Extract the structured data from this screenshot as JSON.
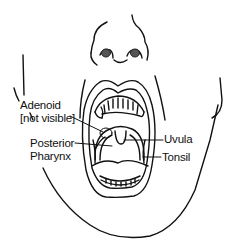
{
  "diagram": {
    "labels": [
      {
        "id": "adenoid",
        "lines": [
          "Adenoid",
          "[not visible]"
        ],
        "x": 20,
        "y": 99
      },
      {
        "id": "posterior-pharynx",
        "lines": [
          "Posterior",
          "Pharynx"
        ],
        "x": 30,
        "y": 137
      },
      {
        "id": "uvula",
        "lines": [
          "Uvula"
        ],
        "x": 164,
        "y": 133
      },
      {
        "id": "tonsil",
        "lines": [
          "Tonsil"
        ],
        "x": 162,
        "y": 151
      }
    ],
    "colors": {
      "line": "#111111",
      "nostril": "#555555",
      "background": "#ffffff"
    }
  }
}
